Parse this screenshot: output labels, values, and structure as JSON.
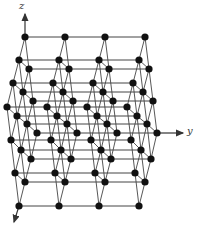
{
  "diagram": {
    "axes": {
      "z": {
        "label": "z"
      },
      "y": {
        "label": "y"
      },
      "x": {
        "label": ""
      }
    },
    "colors": {
      "atom": "#111111",
      "bond": "#444444",
      "axis": "#333333",
      "background": "#ffffff"
    },
    "lattice": {
      "columns": 4,
      "column_spacing_px": 40,
      "atom_radius_px": 3.6,
      "rows": [
        {
          "y": 37,
          "x0": 25
        },
        {
          "y": 60,
          "x0": 19
        },
        {
          "y": 69,
          "x0": 29
        },
        {
          "y": 83,
          "x0": 13
        },
        {
          "y": 92,
          "x0": 23
        },
        {
          "y": 101,
          "x0": 33
        },
        {
          "y": 107,
          "x0": 7
        },
        {
          "y": 116,
          "x0": 17
        },
        {
          "y": 124,
          "x0": 27
        },
        {
          "y": 133,
          "x0": 37
        },
        {
          "y": 140,
          "x0": 11
        },
        {
          "y": 150,
          "x0": 21
        },
        {
          "y": 159,
          "x0": 31
        },
        {
          "y": 173,
          "x0": 15
        },
        {
          "y": 182,
          "x0": 25
        },
        {
          "y": 206,
          "x0": 19
        }
      ]
    }
  }
}
